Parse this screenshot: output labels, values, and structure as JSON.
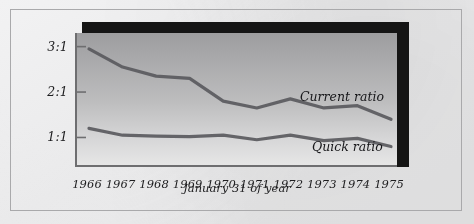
{
  "figure": {
    "background_color": "#ebebec",
    "plot_fill_top": "#9d9d9f",
    "plot_fill_bottom": "#e6e6e6",
    "shadow_color": "#151515",
    "line_color": "#5a5a5e",
    "axis_color": "#6e6e70"
  },
  "axis": {
    "x_title": "January 31 of year",
    "y_ticks": [
      "3:1",
      "2:1",
      "1:1"
    ],
    "x_ticks": [
      "1966",
      "1967",
      "1968",
      "1969",
      "1970",
      "1971",
      "1972",
      "1973",
      "1974",
      "1975"
    ]
  },
  "series_labels": {
    "current": "Current ratio",
    "quick": "Quick ratio"
  },
  "chart_data": {
    "type": "line",
    "title": "",
    "xlabel": "January 31 of year",
    "ylabel": "",
    "x": [
      1966,
      1967,
      1968,
      1969,
      1970,
      1971,
      1972,
      1973,
      1974,
      1975
    ],
    "x_tick_labels": [
      "1966",
      "1967",
      "1968",
      "1969",
      "1970",
      "1971",
      "1972",
      "1973",
      "1974",
      "1975"
    ],
    "y_tick_values": [
      1,
      2,
      3
    ],
    "y_tick_labels": [
      "1:1",
      "2:1",
      "3:1"
    ],
    "ylim": [
      0.35,
      3.3
    ],
    "grid": false,
    "legend": "inline-annotations",
    "series": [
      {
        "name": "Current ratio",
        "values": [
          2.95,
          2.55,
          2.35,
          2.3,
          1.8,
          1.65,
          1.85,
          1.65,
          1.7,
          1.4
        ]
      },
      {
        "name": "Quick ratio",
        "values": [
          1.2,
          1.05,
          1.03,
          1.02,
          1.05,
          0.95,
          1.05,
          0.93,
          0.98,
          0.8
        ]
      }
    ]
  }
}
